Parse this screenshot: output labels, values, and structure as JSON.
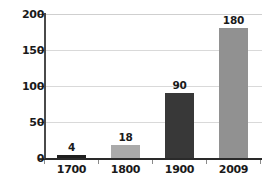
{
  "chart_data": {
    "type": "bar",
    "title": "",
    "xlabel": "",
    "ylabel": "",
    "categories": [
      "1700",
      "1800",
      "1900",
      "2009"
    ],
    "values": [
      4,
      18,
      90,
      180
    ],
    "value_labels": [
      "4",
      "18",
      "90",
      "180"
    ],
    "ylim": [
      0,
      200
    ],
    "yticks": [
      0,
      50,
      100,
      150,
      200
    ],
    "ytick_labels": [
      "0",
      "50",
      "100",
      "150",
      "200"
    ],
    "grid": true,
    "legend": false,
    "bar_colors": [
      "#1f1f1f",
      "#aaaaaa",
      "#383838",
      "#919191"
    ],
    "axis_color": "#2a2a2a",
    "grid_color": "#d9d9d9",
    "background": "#ffffff"
  }
}
